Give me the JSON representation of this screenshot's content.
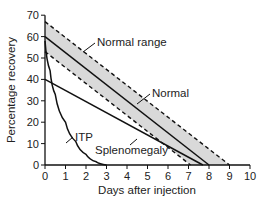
{
  "chart_data": {
    "type": "line",
    "title": "",
    "xlabel": "Days after injection",
    "ylabel": "Percentage recovery",
    "xlim": [
      0,
      10
    ],
    "ylim": [
      0,
      70
    ],
    "xticks": [
      "0",
      "1",
      "2",
      "3",
      "4",
      "5",
      "6",
      "7",
      "8",
      "9",
      "10"
    ],
    "yticks": [
      "0",
      "10",
      "20",
      "30",
      "40",
      "50",
      "60",
      "70"
    ],
    "grid": false,
    "legend": "none (inline annotations)",
    "shaded_band": {
      "name": "Normal range",
      "upper": {
        "x": [
          0,
          9
        ],
        "y": [
          67,
          0
        ],
        "style": "dashed"
      },
      "lower": {
        "x": [
          0,
          7.1
        ],
        "y": [
          53,
          0
        ],
        "style": "dashed"
      },
      "fill": "#d9d9d9"
    },
    "series": [
      {
        "name": "Normal",
        "x": [
          0,
          8
        ],
        "y": [
          60,
          0
        ],
        "style": "solid"
      },
      {
        "name": "Splenomegaly",
        "x": [
          0,
          7.7
        ],
        "y": [
          40,
          0
        ],
        "style": "solid"
      },
      {
        "name": "ITP",
        "x": [
          0,
          0.25,
          0.5,
          1,
          1.5,
          2,
          2.5,
          3
        ],
        "y": [
          58,
          44,
          33,
          20,
          11,
          5,
          1.5,
          0
        ],
        "style": "solid curve"
      }
    ],
    "annotations": [
      "Normal range",
      "Normal",
      "ITP",
      "Splenomegaly"
    ]
  },
  "labels": {
    "xlabel": "Days after injection",
    "ylabel": "Percentage recovery",
    "normal_range": "Normal range",
    "normal": "Normal",
    "itp": "ITP",
    "splenomegaly": "Splenomegaly"
  },
  "colors": {
    "band_fill": "#d9d9d9",
    "line": "#111111"
  }
}
